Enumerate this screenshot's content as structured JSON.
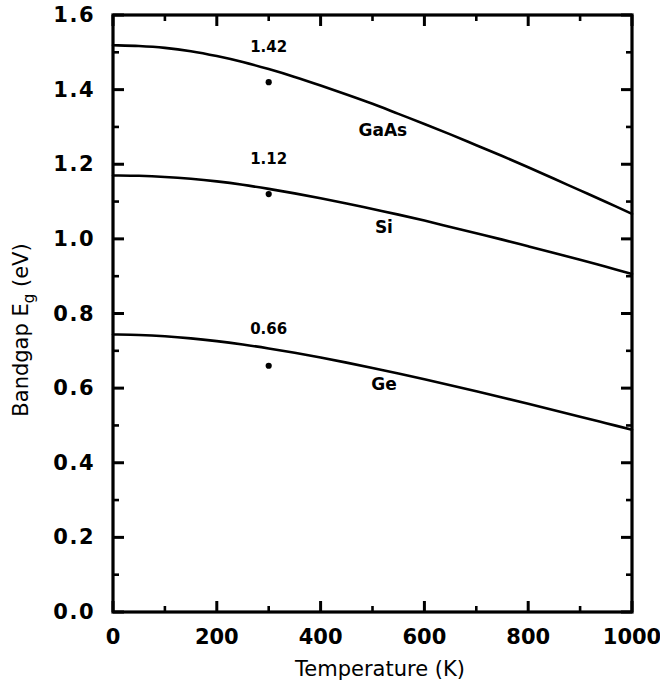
{
  "chart_data": {
    "type": "line",
    "title": "",
    "xlabel": "Temperature  (K)",
    "ylabel": "Bandgap E",
    "ylabel_sub": "g",
    "ylabel_unit": " (eV)",
    "xlim": [
      0,
      1000
    ],
    "ylim": [
      0.0,
      1.6
    ],
    "grid": false,
    "legend_position": "inline-curve-labels",
    "xticks": [
      0,
      200,
      400,
      600,
      800,
      1000
    ],
    "xticklabels": [
      "0",
      "200",
      "400",
      "600",
      "800",
      "1000"
    ],
    "xminor_step": 100,
    "yticks": [
      0.0,
      0.2,
      0.4,
      0.6,
      0.8,
      1.0,
      1.2,
      1.4,
      1.6
    ],
    "yticklabels": [
      "0.0",
      "0.2",
      "0.4",
      "0.6",
      "0.8",
      "1.0",
      "1.2",
      "1.4",
      "1.6"
    ],
    "yminor_step": 0.1,
    "line_color": "#000000",
    "background_color": "#ffffff",
    "axis_color": "#000000",
    "series": [
      {
        "name": "GaAs",
        "label": "GaAs",
        "label_x": 520,
        "label_y": 1.275,
        "x": [
          0,
          50,
          100,
          150,
          200,
          250,
          300,
          350,
          400,
          450,
          500,
          550,
          600,
          650,
          700,
          750,
          800,
          850,
          900,
          950,
          1000
        ],
        "values": [
          1.519,
          1.517,
          1.512,
          1.503,
          1.49,
          1.474,
          1.455,
          1.434,
          1.411,
          1.387,
          1.362,
          1.335,
          1.308,
          1.28,
          1.251,
          1.222,
          1.192,
          1.161,
          1.13,
          1.099,
          1.067
        ],
        "marker_point": {
          "x": 300,
          "y": 1.42,
          "label": "1.42",
          "label_x": 300,
          "label_y": 1.5
        }
      },
      {
        "name": "Si",
        "label": "Si",
        "label_x": 522,
        "label_y": 1.015,
        "x": [
          0,
          50,
          100,
          150,
          200,
          250,
          300,
          350,
          400,
          450,
          500,
          550,
          600,
          650,
          700,
          750,
          800,
          850,
          900,
          950,
          1000
        ],
        "values": [
          1.17,
          1.169,
          1.166,
          1.161,
          1.154,
          1.145,
          1.134,
          1.122,
          1.109,
          1.095,
          1.08,
          1.065,
          1.049,
          1.032,
          1.015,
          0.998,
          0.98,
          0.962,
          0.944,
          0.925,
          0.906
        ],
        "marker_point": {
          "x": 300,
          "y": 1.12,
          "label": "1.12",
          "label_x": 300,
          "label_y": 1.2
        }
      },
      {
        "name": "Ge",
        "label": "Ge",
        "label_x": 522,
        "label_y": 0.595,
        "x": [
          0,
          50,
          100,
          150,
          200,
          250,
          300,
          350,
          400,
          450,
          500,
          550,
          600,
          650,
          700,
          750,
          800,
          850,
          900,
          950,
          1000
        ],
        "values": [
          0.7437,
          0.7425,
          0.739,
          0.7334,
          0.7259,
          0.7168,
          0.7063,
          0.6946,
          0.6819,
          0.6683,
          0.654,
          0.6391,
          0.6236,
          0.6077,
          0.5914,
          0.5748,
          0.5579,
          0.5408,
          0.5235,
          0.506,
          0.4884
        ],
        "marker_point": {
          "x": 300,
          "y": 0.66,
          "label": "0.66",
          "label_x": 300,
          "label_y": 0.745
        }
      }
    ]
  }
}
